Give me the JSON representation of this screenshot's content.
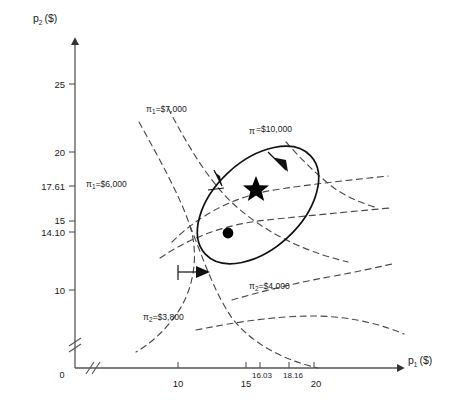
{
  "figure": {
    "type": "diagram",
    "axes": {
      "x": {
        "label": "p",
        "label_sub": "1",
        "label_unit": "($)",
        "ticks": [
          "10",
          "15",
          "16.03",
          "18.16",
          "20"
        ],
        "tick_values": [
          10,
          15,
          16.03,
          18.16,
          20
        ],
        "break_mark": true
      },
      "y": {
        "label": "p",
        "label_sub": "2",
        "label_unit": "($)",
        "ticks": [
          "25",
          "20",
          "17.61",
          "15",
          "14.10",
          "10"
        ],
        "tick_values": [
          25,
          20,
          17.61,
          15,
          14.1,
          10
        ],
        "break_mark": true
      },
      "origin_label": "0"
    },
    "curves": [
      {
        "name": "isoprofit-pi1-7000",
        "label": "π",
        "sub": "1",
        "value": "=$7,000",
        "style": "dashed",
        "owner": "firm1"
      },
      {
        "name": "isoprofit-pi1-6000",
        "label": "π",
        "sub": "1",
        "value": "=$6,000",
        "style": "dashed",
        "owner": "firm1"
      },
      {
        "name": "isoprofit-pi2-4000",
        "label": "π",
        "sub": "2",
        "value": "=$4,000",
        "style": "dashed",
        "owner": "firm2"
      },
      {
        "name": "isoprofit-pi2-3800",
        "label": "π",
        "sub": "2",
        "value": "=$3,800",
        "style": "dashed",
        "owner": "firm2"
      },
      {
        "name": "joint-profit-ellipse",
        "label": "π",
        "sub": "",
        "value": "=$10,000",
        "style": "solid",
        "owner": "joint"
      }
    ],
    "markers": [
      {
        "name": "star-marker",
        "shape": "star",
        "x": 16.03,
        "y": 17.61
      },
      {
        "name": "dot-marker",
        "shape": "circle",
        "x": 15.0,
        "y": 14.1
      }
    ],
    "arrows": [
      {
        "name": "arrow-ellipse-upper-right",
        "direction": "down-right"
      },
      {
        "name": "arrow-ellipse-left",
        "direction": "up"
      },
      {
        "name": "arrow-lower-left-curve",
        "direction": "right"
      }
    ]
  }
}
